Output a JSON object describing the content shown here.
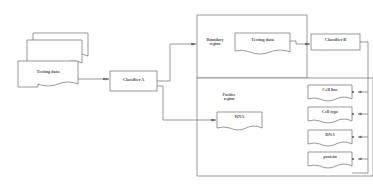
{
  "diagram": {
    "type": "flowchart",
    "stroke_color": "#6e6e6e",
    "background_color": "#ffffff",
    "text_color": "#585858",
    "inputs": {
      "testing_data_stack": {
        "label": "Testing data",
        "shape": "stacked-document",
        "copies": 3
      }
    },
    "nodes": {
      "classifier_a": {
        "label": "Classifier A",
        "shape": "rectangle"
      },
      "classifier_b": {
        "label": "Classifier B",
        "shape": "rectangle"
      },
      "boundary_region": {
        "label": "Boundary\nregion",
        "shape": "container"
      },
      "positive_region": {
        "label": "Positive\nregion",
        "shape": "container"
      },
      "boundary_testing_data": {
        "label": "Testing data",
        "shape": "document"
      },
      "rna": {
        "label": "RNA",
        "shape": "document"
      }
    },
    "outputs": [
      {
        "label": "Cell line",
        "shape": "document"
      },
      {
        "label": "Cell type",
        "shape": "document"
      },
      {
        "label": "DNA",
        "shape": "document"
      },
      {
        "label": "protein",
        "shape": "document"
      }
    ],
    "edges": [
      {
        "from": "testing_data_stack",
        "to": "classifier_a",
        "arrow": true
      },
      {
        "from": "classifier_a",
        "to": "boundary_region",
        "arrow": true
      },
      {
        "from": "classifier_a",
        "to": "rna",
        "arrow": true
      },
      {
        "from": "boundary_testing_data",
        "to": "classifier_b",
        "arrow": true
      },
      {
        "from": "classifier_b",
        "to": "Cell line",
        "arrow": true
      },
      {
        "from": "classifier_b",
        "to": "Cell type",
        "arrow": true
      },
      {
        "from": "classifier_b",
        "to": "DNA",
        "arrow": true
      },
      {
        "from": "classifier_b",
        "to": "protein",
        "arrow": true
      }
    ]
  }
}
